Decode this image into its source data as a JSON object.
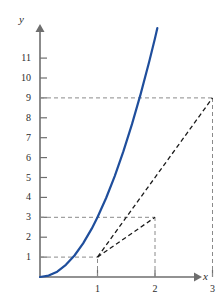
{
  "chart_data": {
    "type": "line",
    "title": "",
    "subtitle": "",
    "xlabel": "x",
    "ylabel": "y",
    "xlim": [
      0,
      3.45
    ],
    "ylim": [
      0,
      12.1
    ],
    "grid": false,
    "legend": "none",
    "axis_labels": {
      "x": "x",
      "y": "y"
    },
    "x_ticks": [
      {
        "value": 1,
        "label": "1"
      },
      {
        "value": 2,
        "label": "2"
      },
      {
        "value": 3,
        "label": "3"
      }
    ],
    "y_ticks": [
      {
        "value": 1,
        "label": "1"
      },
      {
        "value": 2,
        "label": "2"
      },
      {
        "value": 3,
        "label": "3"
      },
      {
        "value": 4,
        "label": "4"
      },
      {
        "value": 5,
        "label": "5"
      },
      {
        "value": 6,
        "label": "6"
      },
      {
        "value": 7,
        "label": "7"
      },
      {
        "value": 8,
        "label": "8"
      },
      {
        "value": 9,
        "label": "9"
      },
      {
        "value": 10,
        "label": "10"
      },
      {
        "value": 11,
        "label": "11"
      }
    ],
    "series": [
      {
        "name": "curve",
        "style": "solid",
        "color": "#1f4e9c",
        "x": [
          0.0,
          0.15,
          0.3,
          0.45,
          0.6,
          0.75,
          0.9,
          1.0,
          1.15,
          1.3,
          1.45,
          1.6,
          1.75,
          1.9,
          2.0,
          2.15,
          2.3,
          2.45,
          2.6,
          2.75,
          2.9,
          3.0,
          3.15,
          3.3,
          3.4
        ],
        "y": [
          0.0,
          0.07,
          0.27,
          0.61,
          1.08,
          1.69,
          2.43,
          3.0,
          3.97,
          5.07,
          6.31,
          7.68,
          9.19,
          10.83,
          12.0,
          13.87,
          15.87,
          18.01,
          20.28,
          22.69,
          25.23,
          27.0,
          29.77,
          32.67,
          34.68
        ]
      },
      {
        "name": "secant-1-to-2",
        "style": "dashed",
        "color": "#1a1a1a",
        "points": [
          {
            "x": 1,
            "y": 1
          },
          {
            "x": 2,
            "y": 3
          }
        ]
      },
      {
        "name": "secant-1-to-3",
        "style": "dashed",
        "color": "#1a1a1a",
        "points": [
          {
            "x": 1,
            "y": 1
          },
          {
            "x": 3,
            "y": 9
          }
        ]
      }
    ],
    "guide_lines": [
      {
        "name": "guide-h-1",
        "orientation": "horizontal",
        "value": 1,
        "from_x": 0,
        "to_x": 1
      },
      {
        "name": "guide-v-1",
        "orientation": "vertical",
        "value": 1,
        "from_y": 0,
        "to_y": 1
      },
      {
        "name": "guide-h-3",
        "orientation": "horizontal",
        "value": 3,
        "from_x": 0,
        "to_x": 2
      },
      {
        "name": "guide-v-2",
        "orientation": "vertical",
        "value": 2,
        "from_y": 0,
        "to_y": 3
      },
      {
        "name": "guide-h-9",
        "orientation": "horizontal",
        "value": 9,
        "from_x": 0,
        "to_x": 3
      },
      {
        "name": "guide-v-3",
        "orientation": "vertical",
        "value": 3,
        "from_y": 0,
        "to_y": 9
      }
    ],
    "marked_points": [
      {
        "x": 1,
        "y": 1
      },
      {
        "x": 2,
        "y": 3
      },
      {
        "x": 3,
        "y": 9
      }
    ],
    "colors": {
      "curve": "#1f4e9c",
      "secant": "#1a1a1a",
      "axis": "#6e6e6e",
      "guide": "#8a8a8a",
      "text": "#2b2b2b",
      "background": "#ffffff"
    }
  }
}
